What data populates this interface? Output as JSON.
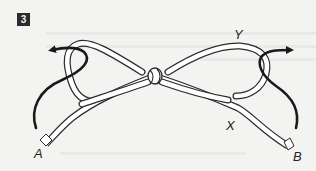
{
  "figure": {
    "step_number": "3",
    "labels": {
      "a": "A",
      "b": "B",
      "x": "X",
      "y": "Y"
    },
    "colors": {
      "background": "#f3f3f1",
      "rope_outline": "#2a2a2a",
      "rope_fill": "#ffffff",
      "arrow": "#1a1a1a",
      "badge": "#2b2b2b"
    }
  }
}
